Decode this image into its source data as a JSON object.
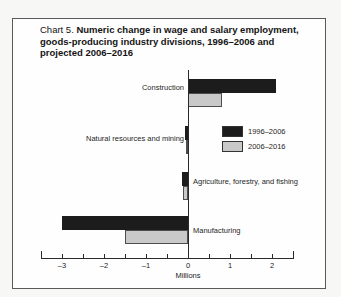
{
  "figure": {
    "title_prefix": "Chart 5.",
    "title_main": "Numeric change in wage and salary employment, goods-producing industry divisions, 1996–2006 and projected 2006–2016"
  },
  "chart_data": {
    "type": "bar",
    "orientation": "horizontal",
    "title": "Chart 5. Numeric change in wage and salary employment, goods-producing industry divisions, 1996–2006 and projected 2006–2016",
    "categories": [
      "Construction",
      "Natural resources and mining",
      "Agriculture, forestry, and fishing",
      "Manufacturing"
    ],
    "series": [
      {
        "name": "1996–2006",
        "color": "#1c1c1c",
        "values": [
          2.1,
          -0.06,
          -0.15,
          -3.0
        ]
      },
      {
        "name": "2006–2016",
        "color": "#c9c9c9",
        "values": [
          0.8,
          -0.04,
          -0.12,
          -1.5
        ]
      }
    ],
    "xlabel": "Millions",
    "xlim": [
      -3.5,
      2.5
    ],
    "xticks": [
      -3,
      -2,
      -1,
      0,
      1,
      2
    ],
    "minor_tick_step": 0.5,
    "grid": false,
    "legend_position": "inside-upper-right",
    "value_axis_unit": "millions of jobs"
  }
}
